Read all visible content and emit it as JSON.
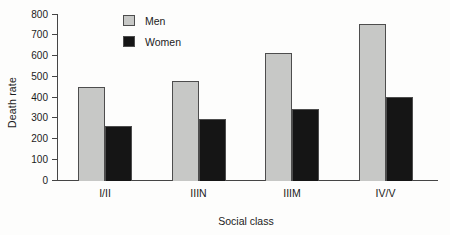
{
  "chart_data": {
    "type": "bar",
    "categories": [
      "I/II",
      "IIIN",
      "IIIM",
      "IV/V"
    ],
    "series": [
      {
        "name": "Men",
        "values": [
          450,
          475,
          610,
          750
        ],
        "color": "#c7c8c6"
      },
      {
        "name": "Women",
        "values": [
          260,
          295,
          340,
          400
        ],
        "color": "#151515"
      }
    ],
    "title": "",
    "xlabel": "Social class",
    "ylabel": "Death rate",
    "ylim": [
      0,
      800
    ],
    "ytick_step": 100,
    "grid": false,
    "legend_position": "top-left-inside",
    "colors": {
      "axis": "#454545",
      "bar_border": "#4d4d4d",
      "text": "#1b1b1b"
    }
  }
}
